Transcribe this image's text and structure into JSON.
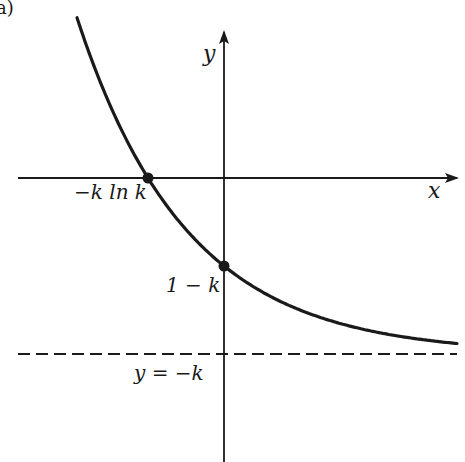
{
  "figure": {
    "panel_label": "a)",
    "colors": {
      "ink": "#1a1a1a",
      "background": "#ffffff"
    }
  },
  "axes": {
    "x_label": "x",
    "y_label": "y",
    "origin_px": [
      224,
      178
    ],
    "x_axis_px": {
      "from": 18,
      "to": 457,
      "y": 178
    },
    "y_axis_px": {
      "x": 224,
      "from": 462,
      "to": 32
    }
  },
  "annotations": {
    "x_intercept": "−k ln k",
    "y_intercept": "1 − k",
    "asymptote": "y = −k"
  },
  "chart_data": {
    "type": "line",
    "title": "",
    "xlabel": "x",
    "ylabel": "y",
    "grid": false,
    "legend": null,
    "series": [
      {
        "name": "y = e^(-x) - k",
        "style": "solid",
        "function_px": {
          "asymptote_y": 354,
          "ref_x": 224,
          "ref_dist": 88,
          "decay_per_px": 0.00912,
          "x_start": 77,
          "x_end": 457
        }
      },
      {
        "name": "y = -k",
        "style": "dashed",
        "line_px": {
          "y": 354,
          "from": 18,
          "to": 457
        }
      }
    ],
    "points": [
      {
        "label": "−k ln k",
        "meaning": "x-intercept",
        "px": [
          148,
          178
        ]
      },
      {
        "label": "1 − k",
        "meaning": "y-intercept",
        "px": [
          224,
          266
        ]
      }
    ]
  }
}
